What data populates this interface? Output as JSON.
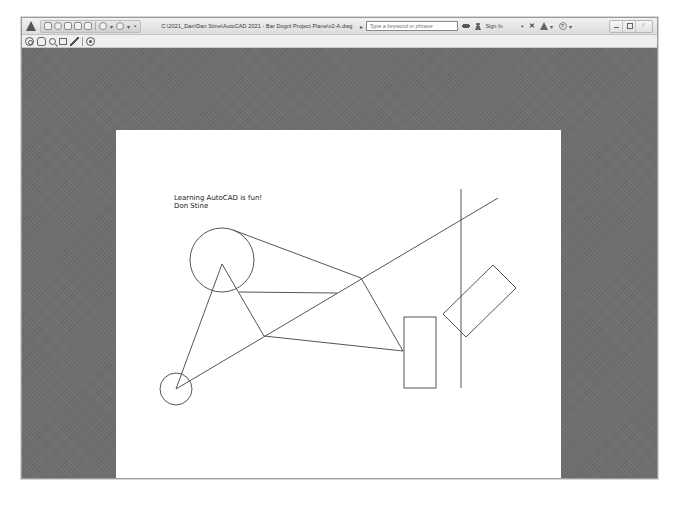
{
  "window": {
    "title": "C:\\2021_Dan\\Dan Stine\\AutoCAD 2021 - Bar Dognl Project Plane\\x2-A.dwg",
    "search": {
      "placeholder": "Type a keyword or phrase"
    },
    "sign_in_label": "Sign In",
    "quick_access_toolbar": {
      "icons": [
        "new-icon",
        "open-icon",
        "save-icon",
        "save-as-icon",
        "plot-icon",
        "undo-icon",
        "redo-icon",
        "workspace-dropdown-icon"
      ]
    },
    "infocenter_icons": [
      "search-expand-icon",
      "binoculars-icon",
      "user-icon",
      "dropdown-icon",
      "exchange-icon",
      "autodesk-app-icon",
      "help-icon"
    ],
    "window_controls": [
      "minimize",
      "restore",
      "close"
    ]
  },
  "navigation_bar": {
    "tools": [
      "steering-wheel",
      "pan",
      "zoom",
      "zoom-window",
      "orbit",
      "showmotion"
    ]
  },
  "drawing": {
    "paper": {
      "x": 94,
      "y": 82,
      "width": 445,
      "height": 349,
      "color": "#ffffff"
    },
    "text_lines": [
      "Learning AutoCAD is fun!",
      "Don Stine"
    ],
    "text_position": {
      "x": 152,
      "y": 152
    },
    "stroke_color": "#555555",
    "circles": [
      {
        "name": "large-circle",
        "cx": 200,
        "cy": 212,
        "r": 32
      },
      {
        "name": "small-circle",
        "cx": 154,
        "cy": 341,
        "r": 16
      }
    ],
    "lines": [
      {
        "name": "triangle-left-side",
        "x1": 200,
        "y1": 216,
        "x2": 154,
        "y2": 341
      },
      {
        "name": "triangle-right-side",
        "x1": 200,
        "y1": 216,
        "x2": 242,
        "y2": 288
      },
      {
        "name": "long-diagonal",
        "x1": 154,
        "y1": 341,
        "x2": 476,
        "y2": 150
      },
      {
        "name": "circle-tangent-line",
        "x1": 211,
        "y1": 182,
        "x2": 339,
        "y2": 230
      },
      {
        "name": "horizontal-line",
        "x1": 217,
        "y1": 244,
        "x2": 315,
        "y2": 245
      },
      {
        "name": "node-to-rect",
        "x1": 339,
        "y1": 230,
        "x2": 381,
        "y2": 303
      },
      {
        "name": "lower-line",
        "x1": 242,
        "y1": 288,
        "x2": 381,
        "y2": 303
      },
      {
        "name": "vertical-line",
        "x1": 439,
        "y1": 141,
        "x2": 439,
        "y2": 340
      }
    ],
    "rectangle": {
      "x": 382,
      "y": 269,
      "width": 32,
      "height": 71
    },
    "rotated_rectangle": {
      "points": "471,217 494,240 444,289 421,266"
    }
  }
}
